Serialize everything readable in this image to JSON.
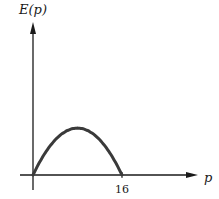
{
  "chart_data": {
    "type": "line",
    "title": "",
    "xlabel": "p",
    "ylabel": "E(p)",
    "x_ticks": [
      "16"
    ],
    "x_tick_values": [
      16
    ],
    "xlim": [
      -2,
      28
    ],
    "ylim": [
      -1.2,
      5
    ],
    "grid": false,
    "legend": "none",
    "series": [
      {
        "name": "E(p)",
        "description": "Concave-down curve starting at p=0, peaking near p=8, returning to zero at p=16 (relative units, no y ticks shown)",
        "x": [
          0,
          1,
          2,
          3,
          4,
          5,
          6,
          7,
          8,
          9,
          10,
          11,
          12,
          13,
          14,
          15,
          16
        ],
        "y": [
          0,
          0.94,
          1.75,
          2.44,
          3.0,
          3.44,
          3.75,
          3.94,
          4.0,
          3.94,
          3.75,
          3.44,
          3.0,
          2.44,
          1.75,
          0.94,
          0
        ]
      }
    ],
    "colors": {
      "axis": "#1a1a1a",
      "curve": "#3a3a3a"
    }
  }
}
